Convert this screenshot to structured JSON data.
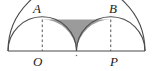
{
  "figure": {
    "labels": {
      "A": "A",
      "B": "B",
      "O": "O",
      "P": "P"
    },
    "colors": {
      "stroke": "#4a4a4a",
      "shade_fill": "#9b9b9b",
      "baseline": "#4a4a4a",
      "dashed": "#555555",
      "background": "#ffffff"
    },
    "geometry": {
      "baseline_y": 51,
      "left_end_x": 8,
      "right_end_x": 145,
      "center_x": 76.5,
      "big_radius": 68.5,
      "small_radius": 34.25,
      "O_x": 42.25,
      "P_x": 110.75,
      "A": {
        "x": 42.25,
        "y": 19.5
      },
      "B": {
        "x": 110.75,
        "y": 19.5
      }
    },
    "elements": [
      "large-semicircle",
      "left-small-semicircle",
      "right-small-semicircle",
      "segment-AB",
      "dashed-AO",
      "dashed-BP",
      "shaded-region",
      "center-tick"
    ]
  }
}
